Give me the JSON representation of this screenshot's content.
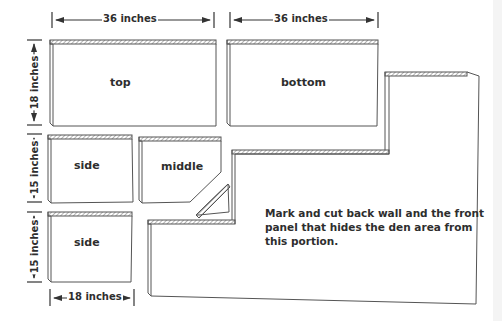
{
  "diagram": {
    "title": "",
    "panels": [
      {
        "id": "top",
        "label": "top"
      },
      {
        "id": "bottom",
        "label": "bottom"
      },
      {
        "id": "side1",
        "label": "side"
      },
      {
        "id": "middle",
        "label": "middle"
      },
      {
        "id": "side2",
        "label": "side"
      },
      {
        "id": "back",
        "label": ""
      }
    ],
    "dimensions": {
      "top_width": "36 inches",
      "bottom_width": "36 inches",
      "top_height": "18 inches",
      "side1_height": "15 inches",
      "side2_height": "15 inches",
      "side_width": "18 inches"
    },
    "note": "Mark and cut back wall and the front panel that hides the den area from this portion.",
    "colors": {
      "line": "#555555",
      "text": "#2e2e2e",
      "background": "#ffffff"
    }
  }
}
